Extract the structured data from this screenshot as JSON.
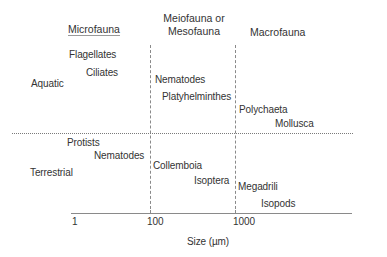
{
  "diagram": {
    "title": "",
    "x_axis": {
      "label": "Size (µm)",
      "scale": "log",
      "ticks": [
        "1",
        "100",
        "1000"
      ]
    },
    "columns": [
      {
        "id": "micro",
        "label": "Microfauna",
        "range": "< 100 µm"
      },
      {
        "id": "meso",
        "label_line1": "Meiofauna or",
        "label_line2": "Mesofauna",
        "range": "100–1000 µm"
      },
      {
        "id": "macro",
        "label": "Macrofauna",
        "range": "> 1000 µm"
      }
    ],
    "rows": [
      {
        "id": "aquatic",
        "label": "Aquatic"
      },
      {
        "id": "terrestrial",
        "label": "Terrestrial"
      }
    ],
    "cells": {
      "aquatic_micro": [
        "Flagellates",
        "Ciliates"
      ],
      "aquatic_meso": [
        "Nematodes",
        "Platyhelminthes"
      ],
      "aquatic_macro": [
        "Polychaeta",
        "Mollusca"
      ],
      "terrestrial_micro": [
        "Protists",
        "Nematodes"
      ],
      "terrestrial_meso": [
        "Collemboia",
        "Isoptera"
      ],
      "terrestrial_macro": [
        "Megadrili",
        "Isopods"
      ]
    },
    "colors": {
      "text": "#333333",
      "lines": "#8a8a8a"
    }
  }
}
